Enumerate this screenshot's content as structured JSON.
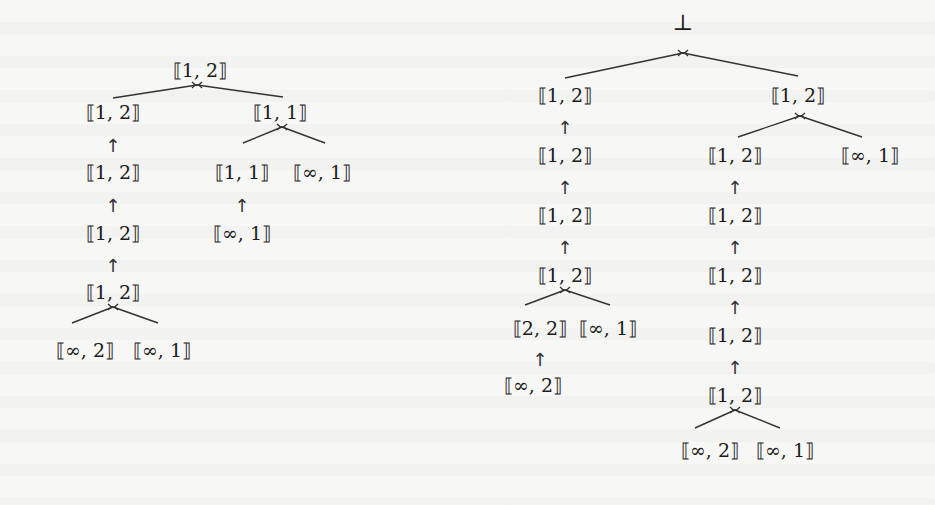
{
  "figure": {
    "symbols": {
      "arrow": "↑",
      "bottom": "⊥",
      "join_marker": "join-icon"
    },
    "left_tree": {
      "nodes": [
        {
          "id": "L0",
          "label": "⟦1, 2⟧",
          "x": 200,
          "y": 70
        },
        {
          "id": "L1",
          "label": "⟦1, 2⟧",
          "x": 113,
          "y": 112
        },
        {
          "id": "L2",
          "label": "⟦1, 2⟧",
          "x": 113,
          "y": 172
        },
        {
          "id": "L3",
          "label": "⟦1, 2⟧",
          "x": 113,
          "y": 233
        },
        {
          "id": "L4",
          "label": "⟦1, 2⟧",
          "x": 113,
          "y": 292
        },
        {
          "id": "L5",
          "label": "⟦∞, 2⟧",
          "x": 85,
          "y": 350
        },
        {
          "id": "L6",
          "label": "⟦∞, 1⟧",
          "x": 162,
          "y": 350
        },
        {
          "id": "L7",
          "label": "⟦1, 1⟧",
          "x": 280,
          "y": 112
        },
        {
          "id": "L8",
          "label": "⟦1, 1⟧",
          "x": 242,
          "y": 172
        },
        {
          "id": "L9",
          "label": "⟦∞, 1⟧",
          "x": 322,
          "y": 172
        },
        {
          "id": "L10",
          "label": "⟦∞, 1⟧",
          "x": 242,
          "y": 233
        }
      ],
      "joins": [
        {
          "at": "L0",
          "x": 197,
          "y": 85,
          "children": [
            [
              113,
              98
            ],
            [
              283,
              97
            ]
          ]
        },
        {
          "at": "L4",
          "x": 113,
          "y": 307,
          "children": [
            [
              72,
              323
            ],
            [
              158,
              323
            ]
          ]
        },
        {
          "at": "L7",
          "x": 282,
          "y": 127,
          "children": [
            [
              243,
              143
            ],
            [
              325,
              143
            ]
          ]
        }
      ],
      "arrows": [
        {
          "from": "L2",
          "to": "L1",
          "x": 113,
          "y": 146
        },
        {
          "from": "L3",
          "to": "L2",
          "x": 113,
          "y": 206
        },
        {
          "from": "L4",
          "to": "L3",
          "x": 113,
          "y": 266
        },
        {
          "from": "L10",
          "to": "L8",
          "x": 242,
          "y": 206
        }
      ]
    },
    "right_tree": {
      "root": {
        "id": "R0",
        "label": "⊥",
        "x": 683,
        "y": 22
      },
      "nodes": [
        {
          "id": "R1",
          "label": "⟦1, 2⟧",
          "x": 565,
          "y": 95
        },
        {
          "id": "R2",
          "label": "⟦1, 2⟧",
          "x": 565,
          "y": 155
        },
        {
          "id": "R3",
          "label": "⟦1, 2⟧",
          "x": 565,
          "y": 215
        },
        {
          "id": "R4",
          "label": "⟦1, 2⟧",
          "x": 565,
          "y": 275
        },
        {
          "id": "R5",
          "label": "⟦2, 2⟧",
          "x": 540,
          "y": 328
        },
        {
          "id": "R6",
          "label": "⟦∞, 1⟧",
          "x": 608,
          "y": 328
        },
        {
          "id": "R7",
          "label": "⟦∞, 2⟧",
          "x": 533,
          "y": 385
        },
        {
          "id": "R8",
          "label": "⟦1, 2⟧",
          "x": 798,
          "y": 95
        },
        {
          "id": "R9",
          "label": "⟦1, 2⟧",
          "x": 735,
          "y": 155
        },
        {
          "id": "R10",
          "label": "⟦∞, 1⟧",
          "x": 870,
          "y": 155
        },
        {
          "id": "R11",
          "label": "⟦1, 2⟧",
          "x": 735,
          "y": 215
        },
        {
          "id": "R12",
          "label": "⟦1, 2⟧",
          "x": 735,
          "y": 275
        },
        {
          "id": "R13",
          "label": "⟦1, 2⟧",
          "x": 735,
          "y": 335
        },
        {
          "id": "R14",
          "label": "⟦1, 2⟧",
          "x": 735,
          "y": 395
        },
        {
          "id": "R15",
          "label": "⟦∞, 2⟧",
          "x": 710,
          "y": 450
        },
        {
          "id": "R16",
          "label": "⟦∞, 1⟧",
          "x": 785,
          "y": 450
        }
      ],
      "joins": [
        {
          "at": "R0",
          "x": 683,
          "y": 53,
          "children": [
            [
              565,
              78
            ],
            [
              798,
              76
            ]
          ]
        },
        {
          "at": "R4",
          "x": 565,
          "y": 290,
          "children": [
            [
              525,
              305
            ],
            [
              610,
              305
            ]
          ]
        },
        {
          "at": "R8",
          "x": 800,
          "y": 116,
          "children": [
            [
              738,
              137
            ],
            [
              862,
              137
            ]
          ]
        },
        {
          "at": "R14",
          "x": 735,
          "y": 410,
          "children": [
            [
              695,
              428
            ],
            [
              780,
              428
            ]
          ]
        }
      ],
      "arrows": [
        {
          "from": "R2",
          "to": "R1",
          "x": 565,
          "y": 128
        },
        {
          "from": "R3",
          "to": "R2",
          "x": 565,
          "y": 188
        },
        {
          "from": "R4",
          "to": "R3",
          "x": 565,
          "y": 248
        },
        {
          "from": "R7",
          "to": "R5",
          "x": 540,
          "y": 360
        },
        {
          "from": "R11",
          "to": "R9",
          "x": 735,
          "y": 188
        },
        {
          "from": "R12",
          "to": "R11",
          "x": 735,
          "y": 248
        },
        {
          "from": "R13",
          "to": "R12",
          "x": 735,
          "y": 308
        },
        {
          "from": "R14",
          "to": "R13",
          "x": 735,
          "y": 368
        }
      ]
    }
  }
}
